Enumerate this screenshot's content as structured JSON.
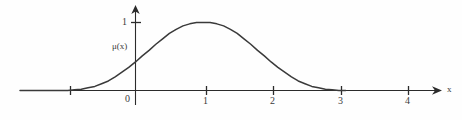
{
  "figure": {
    "background_color": "#fefefe",
    "curve_color": "#3a3a3a",
    "axis_color": "#2b2b2b",
    "width": 462,
    "height": 120
  },
  "labels": {
    "x_axis_name": "x",
    "y_value_one": "1",
    "origin": "0",
    "function_label": "μ(x)"
  },
  "chart_data": {
    "type": "line",
    "title": "",
    "subtitle": "",
    "xlabel": "x",
    "ylabel": "μ(x)",
    "xlim": [
      -1.7,
      4.6
    ],
    "ylim": [
      0,
      1.12
    ],
    "grid": false,
    "legend": null,
    "x_ticks": [
      -1,
      0,
      1,
      2,
      3,
      4
    ],
    "x_tick_labels": [
      "",
      "0",
      "1",
      "2",
      "3",
      "4"
    ],
    "y_ticks": [
      1
    ],
    "y_tick_labels": [
      "1"
    ],
    "annotations": [
      {
        "text": "μ(x)",
        "x": -0.18,
        "y": 0.62
      },
      {
        "text": "x",
        "x": 4.55,
        "y": 0.03
      }
    ],
    "series": [
      {
        "name": "μ(x)",
        "description": "Bell-shaped membership function peaking at 1 when x = 1",
        "x": [
          -1.1,
          -1.0,
          -0.9,
          -0.8,
          -0.7,
          -0.6,
          -0.5,
          -0.4,
          -0.3,
          -0.2,
          -0.1,
          0.0,
          0.1,
          0.2,
          0.3,
          0.4,
          0.5,
          0.6,
          0.7,
          0.8,
          0.9,
          1.0,
          1.1,
          1.2,
          1.3,
          1.4,
          1.5,
          1.6,
          1.7,
          1.8,
          1.9,
          2.0,
          2.1,
          2.2,
          2.3,
          2.4,
          2.5,
          2.6,
          2.7,
          2.8,
          2.9,
          3.0,
          3.1
        ],
        "y": [
          0.0,
          0.0,
          0.01,
          0.02,
          0.04,
          0.06,
          0.1,
          0.14,
          0.2,
          0.27,
          0.34,
          0.42,
          0.51,
          0.59,
          0.68,
          0.76,
          0.84,
          0.9,
          0.95,
          0.98,
          1.0,
          1.0,
          1.0,
          0.98,
          0.95,
          0.9,
          0.84,
          0.76,
          0.68,
          0.59,
          0.51,
          0.42,
          0.34,
          0.27,
          0.2,
          0.14,
          0.1,
          0.06,
          0.04,
          0.02,
          0.01,
          0.0,
          0.0
        ]
      }
    ]
  }
}
